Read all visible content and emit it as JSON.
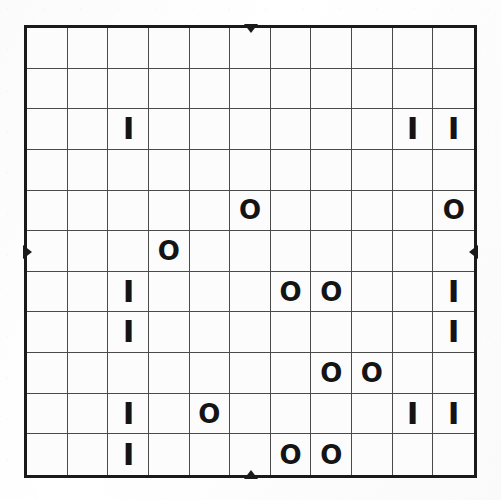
{
  "puzzle": {
    "type": "binary-logic-grid",
    "rows": 11,
    "columns": 11,
    "symbols": {
      "o": "O",
      "i": "I",
      "blank": ""
    },
    "colors": {
      "paper": "#fdfdfd",
      "outer_border": "#1a1a1a",
      "inner_gridline": "#4a4a4a",
      "glyph": "#141414"
    },
    "edge_markers": {
      "top_label": "▼",
      "bottom_label": "▲",
      "left_label": "▶",
      "right_label": "◀",
      "top_column_index": 6,
      "bottom_column_index": 6,
      "left_row_index": 6,
      "right_row_index": 6
    },
    "grid": [
      [
        "",
        "",
        "",
        "",
        "",
        "",
        "",
        "",
        "",
        "",
        ""
      ],
      [
        "",
        "",
        "",
        "",
        "",
        "",
        "",
        "",
        "",
        "",
        ""
      ],
      [
        "",
        "",
        "I",
        "",
        "",
        "",
        "",
        "",
        "",
        "I",
        "I"
      ],
      [
        "",
        "",
        "",
        "",
        "",
        "",
        "",
        "",
        "",
        "",
        ""
      ],
      [
        "",
        "",
        "",
        "",
        "",
        "O",
        "",
        "",
        "",
        "",
        "O"
      ],
      [
        "",
        "",
        "",
        "O",
        "",
        "",
        "",
        "",
        "",
        "",
        ""
      ],
      [
        "",
        "",
        "I",
        "",
        "",
        "",
        "O",
        "O",
        "",
        "",
        "I"
      ],
      [
        "",
        "",
        "I",
        "",
        "",
        "",
        "",
        "",
        "",
        "",
        "I"
      ],
      [
        "",
        "",
        "",
        "",
        "",
        "",
        "",
        "O",
        "O",
        "",
        ""
      ],
      [
        "",
        "",
        "I",
        "",
        "O",
        "",
        "",
        "",
        "",
        "I",
        "I"
      ],
      [
        "",
        "",
        "I",
        "",
        "",
        "",
        "O",
        "O",
        "",
        "",
        ""
      ]
    ]
  }
}
